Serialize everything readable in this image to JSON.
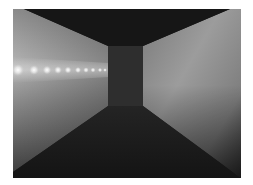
{
  "image": {
    "description": "Grayscale rendered 3D corridor with a dark back wall, dark ceiling and floor, lit side walls and a row of glowing lights along the left wall",
    "colors": {
      "background": "#ffffff",
      "ceiling": "#161616",
      "back_wall": "#2e2e2e",
      "floor": "#1c1c1c",
      "left_wall_light": "#a6a6a6",
      "left_wall_dark": "#3c3c3c",
      "right_wall_light": "#9a9a9a",
      "right_wall_dark": "#2a2a2a",
      "light_glow": "#ffffff"
    },
    "lights": [
      {
        "x": 5,
        "y": 61,
        "r": 4.5
      },
      {
        "x": 21,
        "y": 61,
        "r": 3.8
      },
      {
        "x": 34,
        "y": 61,
        "r": 3.2
      },
      {
        "x": 45,
        "y": 61,
        "r": 2.8
      },
      {
        "x": 55,
        "y": 61,
        "r": 2.5
      },
      {
        "x": 65,
        "y": 61,
        "r": 2.2
      },
      {
        "x": 73,
        "y": 61,
        "r": 2.0
      },
      {
        "x": 80,
        "y": 61,
        "r": 1.8
      },
      {
        "x": 87,
        "y": 61,
        "r": 1.6
      },
      {
        "x": 92,
        "y": 61,
        "r": 1.4
      }
    ]
  }
}
